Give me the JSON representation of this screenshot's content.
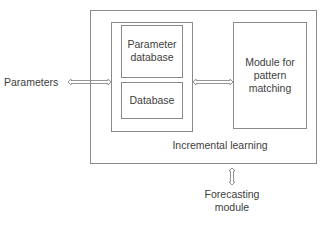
{
  "diagram": {
    "outer_box": {
      "label": "Incremental learning"
    },
    "left_container": {
      "parameter_database": {
        "line1": "Parameter",
        "line2": "database"
      },
      "database": {
        "label": "Database"
      }
    },
    "pattern_module": {
      "line1": "Module for",
      "line2": "pattern",
      "line3": "matching"
    },
    "inputs": {
      "parameters": "Parameters"
    },
    "outputs": {
      "forecasting": {
        "line1": "Forecasting",
        "line2": "module"
      }
    },
    "arrows": [
      {
        "from": "parameters",
        "to": "left_container",
        "type": "double-headed"
      },
      {
        "from": "left_container",
        "to": "pattern_module",
        "type": "double-headed"
      },
      {
        "from": "outer_box",
        "to": "forecasting",
        "type": "double-headed"
      }
    ],
    "colors": {
      "line": "#8a8a8a",
      "text": "#3d3d3d",
      "background": "#ffffff"
    }
  }
}
